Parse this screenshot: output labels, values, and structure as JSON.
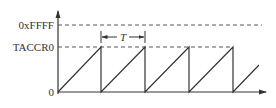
{
  "diagram": {
    "y_labels": {
      "max": "0xFFFF",
      "ccr": "TACCR0",
      "zero": "0"
    },
    "period_label": "T",
    "colors": {
      "line": "#333333",
      "dash": "#555555",
      "background": "#ffffff"
    }
  }
}
